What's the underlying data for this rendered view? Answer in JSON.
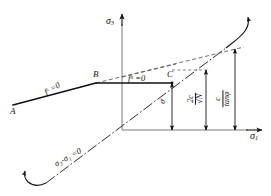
{
  "figure": {
    "kind": "mohr-coulomb-yield-criterion-diagram",
    "axes": {
      "vertical_label": "σ",
      "vertical_sub": "3",
      "horizontal_label": "σ",
      "horizontal_sub": "1"
    },
    "points": {
      "a": "A",
      "b": "B",
      "c": "C"
    },
    "curves": {
      "shear_yield": {
        "label": "f",
        "sup": "s",
        "eq": " =0"
      },
      "tension_yield": {
        "label": "f",
        "sup": "n",
        "eq": " =0"
      },
      "hydrostatic": "σ₃-σ₁ =0"
    },
    "dimensions": [
      {
        "name": "tension-cutoff",
        "label": "σ",
        "sup": "t"
      },
      {
        "name": "uniaxial-compressive-strength",
        "numerator": "2c",
        "denominator": "√N"
      },
      {
        "name": "apex-intercept",
        "numerator": "c",
        "denominator": "tanφ"
      }
    ],
    "colors": {
      "ink": "#141414",
      "thin": "#555555",
      "background": "#ffffff"
    }
  }
}
